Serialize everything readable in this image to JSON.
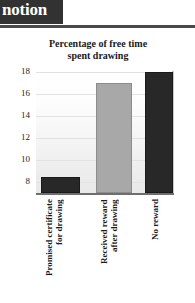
{
  "page_header": {
    "title_fragment": "notion"
  },
  "chart_data": {
    "type": "bar",
    "title": "Percentage of free time spent drawing",
    "title_lines": [
      "Percentage of free time",
      "spent drawing"
    ],
    "categories": [
      "Promised certificate for drawing",
      "Received reward after drawing",
      "No reward"
    ],
    "category_lines": [
      "Promised certificate\nfor drawing",
      "Received reward\nafter drawing",
      "No reward"
    ],
    "values": [
      8.5,
      17,
      18
    ],
    "bar_colors": [
      "#282828",
      "#a8a8a8",
      "#282828"
    ],
    "xlabel": "",
    "ylabel": "",
    "ylim": [
      7,
      19
    ],
    "yticks": [
      18,
      16,
      14,
      12,
      10,
      8
    ],
    "ytick_labels": [
      "18",
      "16",
      "14",
      "12",
      "10",
      "8"
    ],
    "grid": true,
    "legend": "none"
  }
}
